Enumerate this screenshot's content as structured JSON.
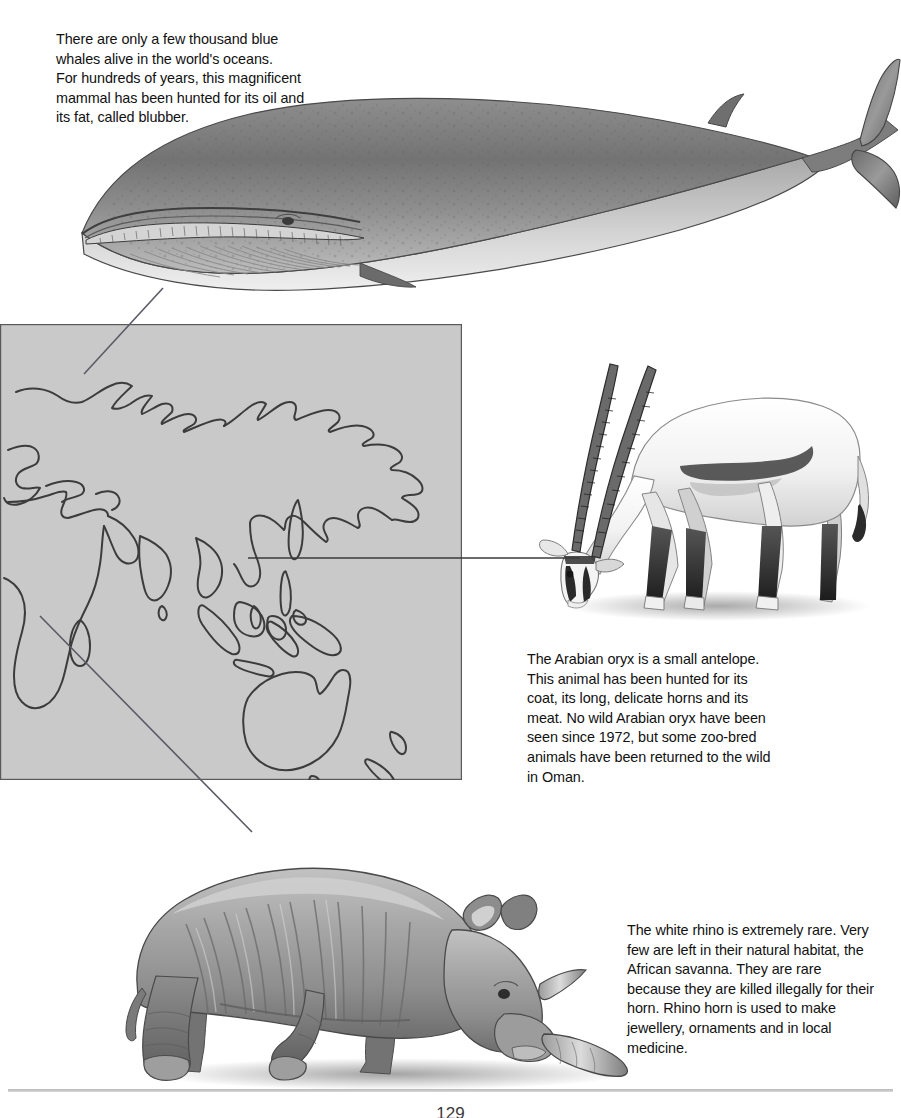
{
  "page": {
    "page_number": "129",
    "background_color": "#ffffff"
  },
  "captions": {
    "whale": "There are only a few thousand blue\nwhales alive in the world's oceans.\nFor hundreds of years, this magnificent\nmammal has been hunted for its oil and\nits fat, called blubber.",
    "oryx": "The Arabian oryx is a small antelope.\nThis animal has been hunted for its\ncoat, its long, delicate horns and its\nmeat. No wild Arabian oryx have been\nseen since 1972, but some zoo-bred\nanimals have been returned to the wild\nin Oman.",
    "rhino": "The white rhino is extremely rare. Very\nfew are left in their natural habitat, the\nAfrican savanna. They are rare\nbecause they are killed illegally for their\nhorn. Rhino horn is used to make\njewellery, ornaments and in local\nmedicine."
  },
  "illustrations": {
    "whale": {
      "name": "blue-whale-illustration",
      "alt": "Blue whale seen from the side"
    },
    "oryx": {
      "name": "arabian-oryx-illustration",
      "alt": "Arabian oryx grazing"
    },
    "rhino": {
      "name": "white-rhino-illustration",
      "alt": "White rhino grazing"
    }
  },
  "map": {
    "name": "world-map",
    "fill_color": "#c9c9c9",
    "border_color": "#555555",
    "outline_color": "#3a3a3a",
    "regions": [
      "Europe",
      "Asia",
      "Africa",
      "Australia",
      "New Zealand",
      "Indonesia",
      "Japan"
    ]
  },
  "connectors": [
    {
      "name": "connector-whale",
      "from": "map-north-atlantic",
      "to": "blue-whale-illustration",
      "color": "#5a5a66"
    },
    {
      "name": "connector-oryx",
      "from": "map-arabia",
      "to": "arabian-oryx-illustration",
      "color": "#3a3a3a"
    },
    {
      "name": "connector-rhino",
      "from": "map-southern-africa",
      "to": "white-rhino-illustration",
      "color": "#5a5a66"
    }
  ]
}
